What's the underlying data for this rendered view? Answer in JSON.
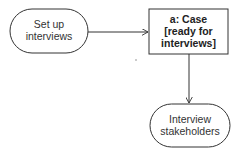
{
  "diagram": {
    "type": "activity",
    "nodes": [
      {
        "id": "setup",
        "kind": "action",
        "lines": [
          "Set up",
          "interviews"
        ]
      },
      {
        "id": "case",
        "kind": "object",
        "lines": [
          "a: Case",
          "[ready for",
          "interviews]"
        ]
      },
      {
        "id": "interview",
        "kind": "action",
        "lines": [
          "Interview",
          "stakeholders"
        ]
      }
    ],
    "edges": [
      {
        "from": "setup",
        "to": "case"
      },
      {
        "from": "case",
        "to": "interview"
      }
    ],
    "colors": {
      "stroke": "#333333",
      "background": "#ffffff",
      "text": "#333333"
    }
  }
}
